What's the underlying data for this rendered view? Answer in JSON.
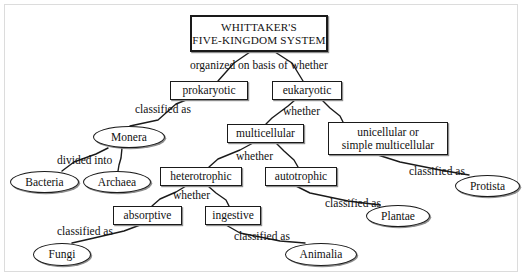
{
  "diagram": {
    "type": "concept-map",
    "canvas": {
      "width": 524,
      "height": 279,
      "background": "#ffffff",
      "border_color": "#dcdcdc"
    },
    "node_style": {
      "stroke": "#1a1a1a",
      "fill": "#ffffff",
      "shadow": "#8d8d8d"
    },
    "nodes": [
      {
        "id": "root",
        "shape": "box",
        "label": "WHITTAKER'S\nFIVE-KINGDOM SYSTEM",
        "line1": "WHITTAKER'S",
        "line2": "FIVE-KINGDOM SYSTEM",
        "x": 190,
        "y": 15,
        "w": 138,
        "h": 37,
        "font_size": 11.2,
        "letter_spacing": 0.2
      },
      {
        "id": "prokaryotic",
        "shape": "box",
        "label": "prokaryotic",
        "x": 170,
        "y": 81,
        "w": 78,
        "h": 19,
        "font_size": 11.5
      },
      {
        "id": "eukaryotic",
        "shape": "box",
        "label": "eukaryotic",
        "x": 272,
        "y": 81,
        "w": 70,
        "h": 19,
        "font_size": 11.5
      },
      {
        "id": "monera",
        "shape": "ellipse",
        "label": "Monera",
        "x": 93,
        "y": 126,
        "w": 72,
        "h": 22,
        "font_size": 11.5
      },
      {
        "id": "multicellular",
        "shape": "box",
        "label": "multicellular",
        "x": 227,
        "y": 124,
        "w": 77,
        "h": 19,
        "font_size": 11.5
      },
      {
        "id": "unicellular",
        "shape": "box",
        "label": "unicellular or\nsimple multicellular",
        "line1": "unicellular or",
        "line2": "simple multicellular",
        "x": 328,
        "y": 122,
        "w": 120,
        "h": 33,
        "font_size": 11.5
      },
      {
        "id": "bacteria",
        "shape": "ellipse",
        "label": "Bacteria",
        "x": 10,
        "y": 171,
        "w": 69,
        "h": 22,
        "font_size": 11.5
      },
      {
        "id": "archaea",
        "shape": "ellipse",
        "label": "Archaea",
        "x": 83,
        "y": 171,
        "w": 68,
        "h": 22,
        "font_size": 11.5
      },
      {
        "id": "heterotrophic",
        "shape": "box",
        "label": "heterotrophic",
        "x": 160,
        "y": 167,
        "w": 82,
        "h": 19,
        "font_size": 11.5
      },
      {
        "id": "autotrophic",
        "shape": "box",
        "label": "autotrophic",
        "x": 265,
        "y": 167,
        "w": 72,
        "h": 19,
        "font_size": 11.5
      },
      {
        "id": "protista",
        "shape": "ellipse",
        "label": "Protista",
        "x": 455,
        "y": 175,
        "w": 65,
        "h": 22,
        "font_size": 11.5
      },
      {
        "id": "absorptive",
        "shape": "box",
        "label": "absorptive",
        "x": 113,
        "y": 206,
        "w": 69,
        "h": 19,
        "font_size": 11.5
      },
      {
        "id": "ingestive",
        "shape": "box",
        "label": "ingestive",
        "x": 205,
        "y": 206,
        "w": 56,
        "h": 19,
        "font_size": 11.5
      },
      {
        "id": "plantae",
        "shape": "ellipse",
        "label": "Plantae",
        "x": 366,
        "y": 205,
        "w": 64,
        "h": 22,
        "font_size": 11.5
      },
      {
        "id": "fungi",
        "shape": "ellipse",
        "label": "Fungi",
        "x": 33,
        "y": 243,
        "w": 58,
        "h": 23,
        "font_size": 11.5
      },
      {
        "id": "animalia",
        "shape": "ellipse",
        "label": "Animalia",
        "x": 285,
        "y": 243,
        "w": 72,
        "h": 23,
        "font_size": 11.5
      }
    ],
    "link_labels": [
      {
        "id": "ll-organized",
        "text": "organized on basis of whether",
        "x": 190,
        "y": 60,
        "font_size": 11.5
      },
      {
        "id": "ll-classified-monera",
        "text": "classified as",
        "x": 135,
        "y": 104,
        "font_size": 11.5
      },
      {
        "id": "ll-whether-euk",
        "text": "whether",
        "x": 283,
        "y": 106,
        "font_size": 11.5
      },
      {
        "id": "ll-divided",
        "text": "divided into",
        "x": 57,
        "y": 155,
        "font_size": 11.5
      },
      {
        "id": "ll-whether-multi",
        "text": "whether",
        "x": 236,
        "y": 151,
        "font_size": 11.5
      },
      {
        "id": "ll-classified-protista",
        "text": "classified as",
        "x": 409,
        "y": 166,
        "font_size": 11.5
      },
      {
        "id": "ll-whether-het",
        "text": "whether",
        "x": 173,
        "y": 190,
        "font_size": 11.5
      },
      {
        "id": "ll-classified-plantae",
        "text": "classified as",
        "x": 325,
        "y": 198,
        "font_size": 11.5
      },
      {
        "id": "ll-classified-fungi",
        "text": "classified as",
        "x": 57,
        "y": 226,
        "font_size": 11.5
      },
      {
        "id": "ll-classified-animalia",
        "text": "classified as",
        "x": 234,
        "y": 231,
        "font_size": 11.5
      }
    ],
    "edges": [
      {
        "id": "e-root-prok",
        "from": "root",
        "to": "prokaryotic",
        "label": "organized on basis of whether",
        "points": "250,52 234,63 218,81"
      },
      {
        "id": "e-root-euk",
        "from": "root",
        "to": "eukaryotic",
        "label": "organized on basis of whether",
        "points": "275,52 292,63 303,81"
      },
      {
        "id": "e-prok-monera",
        "from": "prokaryotic",
        "to": "monera",
        "label": "classified as",
        "points": "186,100 176,104 158,120 130,126"
      },
      {
        "id": "e-euk-multi",
        "from": "eukaryotic",
        "to": "multicellular",
        "label": "whether",
        "points": "295,100 288,106 272,118 266,124"
      },
      {
        "id": "e-euk-uni",
        "from": "eukaryotic",
        "to": "unicellular",
        "label": "whether",
        "points": "322,100 330,108 340,116 343,122"
      },
      {
        "id": "e-monera-bact",
        "from": "monera",
        "to": "bacteria",
        "label": "divided into",
        "points": "108,148 96,154 74,162 62,171"
      },
      {
        "id": "e-monera-arch",
        "from": "monera",
        "to": "archaea",
        "label": "divided into",
        "points": "122,148 121,158 119,165 118,171"
      },
      {
        "id": "e-multi-het",
        "from": "multicellular",
        "to": "heterotrophic",
        "label": "whether",
        "points": "253,143 240,150 218,159 209,167"
      },
      {
        "id": "e-multi-auto",
        "from": "multicellular",
        "to": "autotrophic",
        "label": "whether",
        "points": "276,143 284,151 294,160 298,167"
      },
      {
        "id": "e-uni-prot",
        "from": "unicellular",
        "to": "protista",
        "label": "classified as",
        "points": "378,155 400,162 440,170 469,175"
      },
      {
        "id": "e-het-abs",
        "from": "heterotrophic",
        "to": "absorptive",
        "label": "whether",
        "points": "186,186 176,192 160,199 152,206"
      },
      {
        "id": "e-het-ing",
        "from": "heterotrophic",
        "to": "ingestive",
        "label": "whether",
        "points": "208,186 216,193 226,200 229,206"
      },
      {
        "id": "e-auto-plant",
        "from": "autotrophic",
        "to": "plantae",
        "label": "classified as",
        "points": "296,186 310,193 348,201 380,205"
      },
      {
        "id": "e-abs-fungi",
        "from": "absorptive",
        "to": "fungi",
        "label": "classified as",
        "points": "140,225 124,231 94,238 72,243"
      },
      {
        "id": "e-ing-anim",
        "from": "ingestive",
        "to": "animalia",
        "label": "classified as",
        "points": "226,225 240,233 280,241 305,243"
      }
    ]
  }
}
